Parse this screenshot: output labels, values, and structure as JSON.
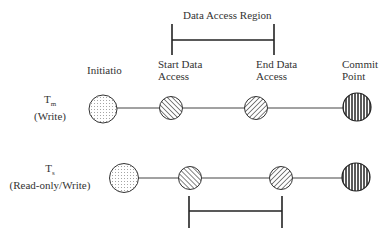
{
  "top_bracket": {
    "label": "Data Access Region"
  },
  "columns": {
    "initiation": "Initiatio",
    "start": [
      "Start Data",
      "Access"
    ],
    "end": [
      "End Data",
      "Access"
    ],
    "commit": [
      "Commit",
      "Point"
    ]
  },
  "rows": [
    {
      "name": "T",
      "sub": "m",
      "role": "(Write)"
    },
    {
      "name": "T",
      "sub": "s",
      "role": "(Read-only/Write)"
    }
  ],
  "patterns": {
    "initiation": "dotted",
    "start": "diagonal-back",
    "end": "diagonal-forward",
    "commit": "vertical-stripes"
  }
}
